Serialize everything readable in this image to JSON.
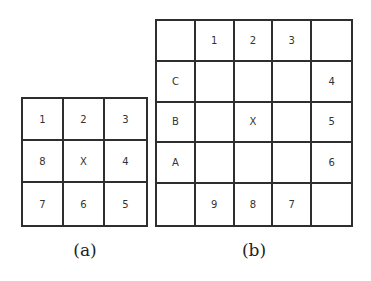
{
  "figure_a": {
    "caption": "(a)",
    "rows": 3,
    "cols": 3,
    "cells": [
      [
        "1",
        "2",
        "3"
      ],
      [
        "8",
        "X",
        "4"
      ],
      [
        "7",
        "6",
        "5"
      ]
    ]
  },
  "figure_b": {
    "caption": "(b)",
    "rows": 5,
    "cols": 5,
    "cells": [
      [
        "",
        "1",
        "2",
        "3",
        ""
      ],
      [
        "C",
        "",
        "",
        "",
        "4"
      ],
      [
        "B",
        "",
        "X",
        "",
        "5"
      ],
      [
        "A",
        "",
        "",
        "",
        "6"
      ],
      [
        "",
        "9",
        "8",
        "7",
        ""
      ]
    ]
  },
  "colors": {
    "border": "#2e2e2e",
    "text": "#333333",
    "background": "#ffffff"
  }
}
